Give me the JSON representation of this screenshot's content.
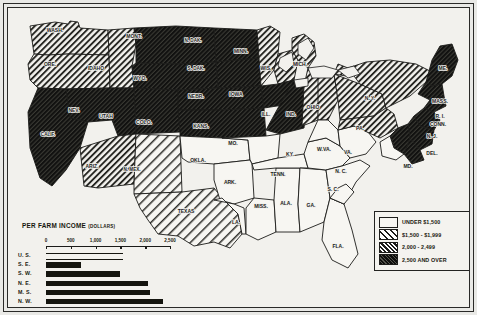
{
  "map": {
    "title": "Per Farm Income, United States",
    "states": [
      {
        "code": "WASH.",
        "label": "WASH.",
        "class": "2000-2499",
        "x": 47,
        "y": 24
      },
      {
        "code": "ORE.",
        "label": "ORE.",
        "class": "2000-2499",
        "x": 42,
        "y": 58
      },
      {
        "code": "IDAHO",
        "label": "IDAHO",
        "class": "2000-2499",
        "x": 88,
        "y": 62
      },
      {
        "code": "MONT.",
        "label": "MONT.",
        "class": "2500+",
        "x": 126,
        "y": 30
      },
      {
        "code": "N.DAK.",
        "label": "N. DAK.",
        "class": "2500+",
        "x": 185,
        "y": 34
      },
      {
        "code": "S.DAK.",
        "label": "S. DAK.",
        "class": "2500+",
        "x": 188,
        "y": 62
      },
      {
        "code": "MINN.",
        "label": "MINN.",
        "class": "2000-2499",
        "x": 233,
        "y": 45
      },
      {
        "code": "WIS.",
        "label": "WIS.",
        "class": "2000-2499",
        "x": 258,
        "y": 62
      },
      {
        "code": "MICH.",
        "label": "MICH.",
        "class": "2000-2499",
        "x": 292,
        "y": 58
      },
      {
        "code": "CALIF.",
        "label": "CALIF.",
        "class": "2500+",
        "x": 40,
        "y": 128
      },
      {
        "code": "NEV.",
        "label": "NEV.",
        "class": "2500+",
        "x": 66,
        "y": 104
      },
      {
        "code": "UTAH",
        "label": "UTAH",
        "class": "2500+",
        "x": 98,
        "y": 110
      },
      {
        "code": "WYO.",
        "label": "WYO.",
        "class": "2500+",
        "x": 132,
        "y": 72
      },
      {
        "code": "COLO.",
        "label": "COLO.",
        "class": "2500+",
        "x": 136,
        "y": 116
      },
      {
        "code": "NEBR.",
        "label": "NEBR.",
        "class": "2500+",
        "x": 188,
        "y": 90
      },
      {
        "code": "KANS.",
        "label": "KANS.",
        "class": "2500+",
        "x": 193,
        "y": 120
      },
      {
        "code": "IOWA",
        "label": "IOWA",
        "class": "2500+",
        "x": 228,
        "y": 88
      },
      {
        "code": "ILL.",
        "label": "ILL.",
        "class": "2500+",
        "x": 258,
        "y": 108
      },
      {
        "code": "IND.",
        "label": "IND.",
        "class": "2000-2499",
        "x": 283,
        "y": 108
      },
      {
        "code": "OHIO",
        "label": "OHIO",
        "class": "2000-2499",
        "x": 305,
        "y": 101
      },
      {
        "code": "ARIZ.",
        "label": "ARIZ.",
        "class": "2000-2499",
        "x": 84,
        "y": 160
      },
      {
        "code": "N.MEX.",
        "label": "N. MEX.",
        "class": "1500-1999",
        "x": 124,
        "y": 163
      },
      {
        "code": "OKLA.",
        "label": "OKLA.",
        "class": "under1500",
        "x": 190,
        "y": 154
      },
      {
        "code": "TEXAS",
        "label": "TEXAS",
        "class": "1500-1999",
        "x": 178,
        "y": 205
      },
      {
        "code": "MO.",
        "label": "MO.",
        "class": "under1500",
        "x": 225,
        "y": 137
      },
      {
        "code": "ARK.",
        "label": "ARK.",
        "class": "under1500",
        "x": 222,
        "y": 176
      },
      {
        "code": "LA.",
        "label": "LA.",
        "class": "under1500",
        "x": 228,
        "y": 216
      },
      {
        "code": "MISS.",
        "label": "MISS.",
        "class": "under1500",
        "x": 253,
        "y": 200
      },
      {
        "code": "ALA.",
        "label": "ALA.",
        "class": "under1500",
        "x": 278,
        "y": 197
      },
      {
        "code": "TENN.",
        "label": "TENN.",
        "class": "under1500",
        "x": 270,
        "y": 168
      },
      {
        "code": "KY.",
        "label": "KY.",
        "class": "under1500",
        "x": 282,
        "y": 148
      },
      {
        "code": "GA.",
        "label": "GA.",
        "class": "under1500",
        "x": 303,
        "y": 199
      },
      {
        "code": "FLA.",
        "label": "FLA.",
        "class": "under1500",
        "x": 330,
        "y": 240
      },
      {
        "code": "S.C.",
        "label": "S. C.",
        "class": "under1500",
        "x": 325,
        "y": 183
      },
      {
        "code": "N.C.",
        "label": "N. C.",
        "class": "under1500",
        "x": 333,
        "y": 165
      },
      {
        "code": "VA.",
        "label": "VA.",
        "class": "under1500",
        "x": 340,
        "y": 146
      },
      {
        "code": "W.VA.",
        "label": "W.VA.",
        "class": "under1500",
        "x": 316,
        "y": 143
      },
      {
        "code": "PA.",
        "label": "PA.",
        "class": "2000-2499",
        "x": 352,
        "y": 122
      },
      {
        "code": "N.Y.",
        "label": "N. Y.",
        "class": "2000-2499",
        "x": 362,
        "y": 92
      },
      {
        "code": "ME.",
        "label": "ME.",
        "class": "2500+",
        "x": 435,
        "y": 62
      },
      {
        "code": "MASS.",
        "label": "MASS.",
        "class": "2500+",
        "x": 432,
        "y": 95
      },
      {
        "code": "R.I.",
        "label": "R. I.",
        "class": "2500+",
        "x": 432,
        "y": 110
      },
      {
        "code": "CONN.",
        "label": "CONN.",
        "class": "2500+",
        "x": 430,
        "y": 118
      },
      {
        "code": "N.J.",
        "label": "N. J.",
        "class": "2500+",
        "x": 424,
        "y": 130
      },
      {
        "code": "DEL.",
        "label": "DEL.",
        "class": "2500+",
        "x": 424,
        "y": 147
      },
      {
        "code": "MD.",
        "label": "MD.",
        "class": "under1500",
        "x": 400,
        "y": 160
      }
    ]
  },
  "legend": {
    "items": [
      {
        "label": "UNDER $1,500",
        "pattern": "none",
        "swatch": "#f7f6f2"
      },
      {
        "label": "$1,500 - $1,999",
        "pattern": "light",
        "swatch": "#ffffff"
      },
      {
        "label": "2,000 -  2,499",
        "pattern": "medium",
        "swatch": "#ffffff"
      },
      {
        "label": "2,500 AND OVER",
        "pattern": "dark",
        "swatch": "#ffffff"
      }
    ]
  },
  "chart_data": {
    "type": "bar",
    "title": "PER FARM INCOME",
    "title_unit": "(DOLLARS)",
    "orientation": "horizontal",
    "categories": [
      "U. S.",
      "S. E.",
      "S. W.",
      "N. E.",
      "M. S.",
      "N. W.",
      "F. W."
    ],
    "values": [
      1550,
      700,
      1500,
      2050,
      2100,
      2350,
      3050
    ],
    "styles": [
      "hollow",
      "solid",
      "solid",
      "solid",
      "solid",
      "solid",
      "solid"
    ],
    "xlabel": "",
    "ylabel": "",
    "xlim": [
      0,
      2500
    ],
    "tick_labels": [
      "0",
      "500",
      "1,000",
      "1,500",
      "2,000",
      "2,500"
    ],
    "tick_values": [
      0,
      500,
      1000,
      1500,
      2000,
      2500
    ],
    "grid": false,
    "legend": "none",
    "note": "F. W. bar extends beyond the 2,500 axis end"
  },
  "colors": {
    "ink": "#1b1b19",
    "plate": "#f2f1ed",
    "paper": "#e9e9e6",
    "dark_fill": "#2b2b27"
  }
}
